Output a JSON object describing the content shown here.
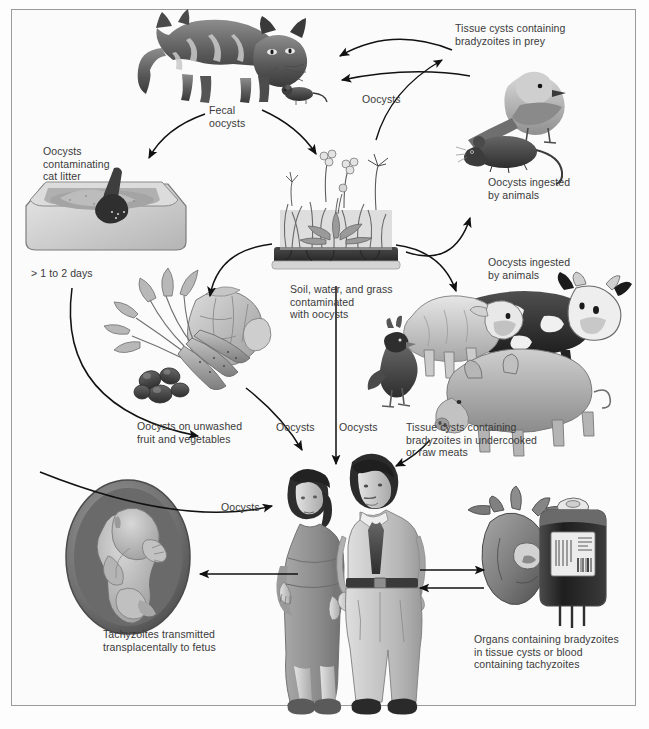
{
  "diagram": {
    "frame_color": "#9a9a9a",
    "background_color": "#fbfbfb",
    "text_color": "#3a3a3a"
  },
  "labels": [
    {
      "id": "tissue-cysts-prey",
      "text": "Tissue cysts containing\nbradyzoites in prey",
      "x": 455,
      "y": 22
    },
    {
      "id": "fecal-oocysts",
      "text": "Fecal\noocysts",
      "x": 209,
      "y": 104
    },
    {
      "id": "oocysts-top-right",
      "text": "Oocysts",
      "x": 362,
      "y": 93
    },
    {
      "id": "oocysts-cat-litter",
      "text": "Oocysts\ncontaminating\ncat litter",
      "x": 43,
      "y": 145
    },
    {
      "id": "oocysts-ingested-birds",
      "text": "Oocysts ingested\nby animals",
      "x": 488,
      "y": 176
    },
    {
      "id": "soil-water-grass",
      "text": "Soil, water, and grass\ncontaminated\nwith oocysts",
      "x": 290,
      "y": 283
    },
    {
      "id": "oocysts-ingested-farm",
      "text": "Oocysts ingested\nby animals",
      "x": 488,
      "y": 256
    },
    {
      "id": "one-to-two-days",
      "text": "> 1 to 2 days",
      "x": 31,
      "y": 267
    },
    {
      "id": "oocysts-unwashed",
      "text": "Oocysts on unwashed\nfruit and vegetables",
      "x": 137,
      "y": 420
    },
    {
      "id": "oocysts-mid-left",
      "text": "Oocysts",
      "x": 276,
      "y": 421
    },
    {
      "id": "oocysts-mid-right",
      "text": "Oocysts",
      "x": 339,
      "y": 421
    },
    {
      "id": "tissue-cysts-meats",
      "text": "Tissue cysts containing\nbradyzoites in undercooked\nor raw meats",
      "x": 406,
      "y": 421
    },
    {
      "id": "oocysts-to-woman",
      "text": "Oocysts",
      "x": 221,
      "y": 501
    },
    {
      "id": "tachyzoites-fetus",
      "text": "Tachyzoites transmitted\ntransplacentally to fetus",
      "x": 103,
      "y": 628
    },
    {
      "id": "organs-blood",
      "text": "Organs containing bradyzoites\nin tissue cysts or blood\ncontaining tachyzoites",
      "x": 474,
      "y": 633
    }
  ],
  "figures": [
    {
      "id": "cat",
      "name": "cat-illustration"
    },
    {
      "id": "mouse-top",
      "name": "mouse-illustration"
    },
    {
      "id": "bird",
      "name": "bird-illustration"
    },
    {
      "id": "mouse-right",
      "name": "mouse-prey-illustration"
    },
    {
      "id": "litter-box",
      "name": "cat-litter-box-illustration"
    },
    {
      "id": "grass-plot",
      "name": "soil-grass-illustration"
    },
    {
      "id": "vegetables",
      "name": "fruit-and-vegetables-illustration"
    },
    {
      "id": "farm-animals",
      "name": "farm-animals-illustration"
    },
    {
      "id": "pregnant-woman",
      "name": "pregnant-woman-illustration"
    },
    {
      "id": "man",
      "name": "man-illustration"
    },
    {
      "id": "fetus",
      "name": "fetus-in-womb-illustration"
    },
    {
      "id": "heart",
      "name": "heart-organ-illustration"
    },
    {
      "id": "blood-bag",
      "name": "blood-bag-illustration"
    }
  ]
}
